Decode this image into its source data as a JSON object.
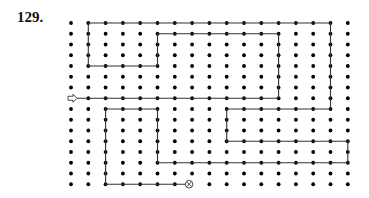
{
  "puzzle": {
    "number_label": "129.",
    "grid": {
      "cols": 17,
      "rows": 16,
      "origin_x": 71,
      "origin_y": 23,
      "step_x": 17.3,
      "step_y": 10.75,
      "dot_radius": 1.9,
      "dot_color": "#000000"
    },
    "path": {
      "color": "#333333",
      "stroke_width": 1.1,
      "points": [
        [
          0,
          7
        ],
        [
          12,
          7
        ],
        [
          12,
          1
        ],
        [
          5,
          1
        ],
        [
          5,
          4
        ],
        [
          1,
          4
        ],
        [
          1,
          0
        ],
        [
          15,
          0
        ],
        [
          15,
          8
        ],
        [
          9,
          8
        ],
        [
          9,
          11
        ],
        [
          16,
          11
        ],
        [
          16,
          13
        ],
        [
          5,
          13
        ],
        [
          5,
          8
        ],
        [
          2,
          8
        ],
        [
          2,
          15
        ],
        [
          7,
          15
        ]
      ]
    },
    "start": {
      "icon": "arrow-right-outline-icon",
      "col": 0,
      "row": 7
    },
    "end": {
      "icon": "circle-x-icon",
      "col": 7,
      "row": 15
    }
  }
}
